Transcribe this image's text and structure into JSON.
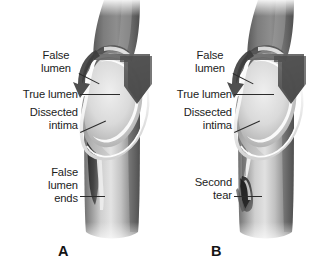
{
  "figure": {
    "kind": "medical-illustration",
    "background_color": "#ffffff",
    "palette": {
      "ink": "#1c1c1c",
      "leader_line": "#2b2b2b",
      "vessel_dark": "#4a4a4a",
      "vessel_mid": "#8c8c8c",
      "vessel_light": "#d9d9d9",
      "vessel_highlight": "#f2f2f2",
      "arrow": "#585858",
      "shadow": "#3a3a3a"
    }
  },
  "panels": [
    {
      "id": "A",
      "letter": "A",
      "labels": [
        {
          "name": "false-lumen",
          "text": "False\nlumen",
          "align": "center"
        },
        {
          "name": "true-lumen",
          "text": "True lumen",
          "align": "right"
        },
        {
          "name": "dissected-intima",
          "text": "Dissected\nintima",
          "align": "right"
        },
        {
          "name": "false-lumen-ends",
          "text": "False\nlumen\nends",
          "align": "right"
        }
      ]
    },
    {
      "id": "B",
      "letter": "B",
      "labels": [
        {
          "name": "false-lumen",
          "text": "False\nlumen",
          "align": "center"
        },
        {
          "name": "true-lumen",
          "text": "True lumen",
          "align": "right"
        },
        {
          "name": "dissected-intima",
          "text": "Dissected\nintima",
          "align": "right"
        },
        {
          "name": "second-tear",
          "text": "Second\ntear",
          "align": "right"
        }
      ]
    }
  ],
  "panel_a": {
    "letter": "A",
    "label_false_lumen": "False\nlumen",
    "label_true_lumen": "True lumen",
    "label_dissected_intima": "Dissected\nintima",
    "label_false_lumen_ends": "False\nlumen\nends"
  },
  "panel_b": {
    "letter": "B",
    "label_false_lumen": "False\nlumen",
    "label_true_lumen": "True lumen",
    "label_dissected_intima": "Dissected\nintima",
    "label_second_tear": "Second\ntear"
  }
}
